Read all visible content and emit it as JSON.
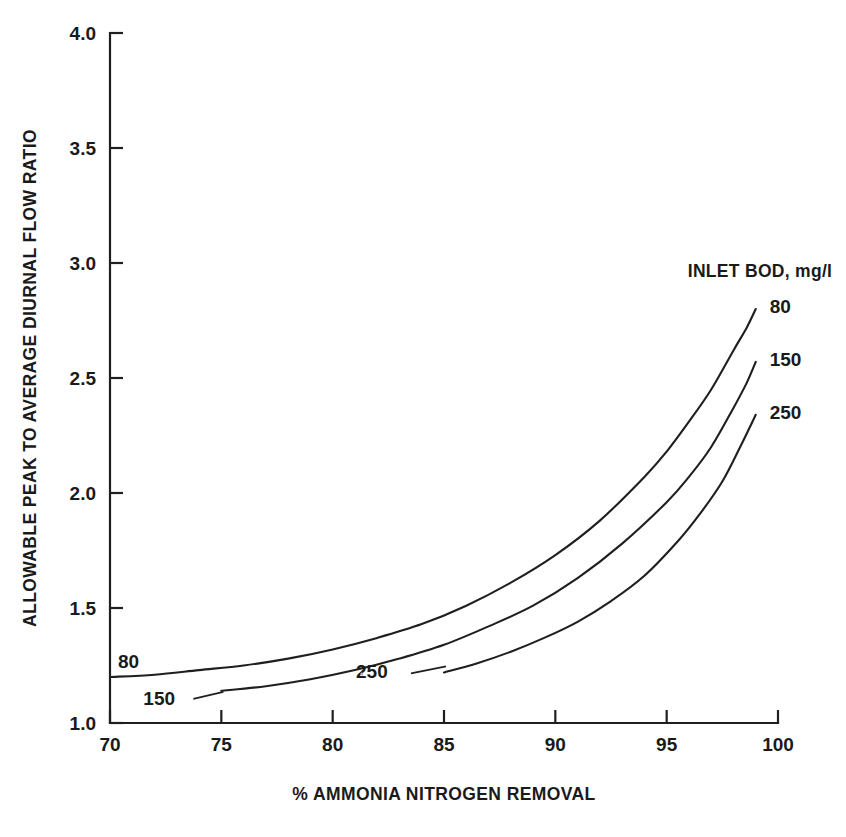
{
  "chart_data": {
    "type": "line",
    "title": "",
    "xlabel": "% AMMONIA NITROGEN REMOVAL",
    "ylabel": "ALLOWABLE PEAK TO AVERAGE DIURNAL FLOW RATIO",
    "xlim": [
      70,
      100
    ],
    "ylim": [
      1.0,
      4.0
    ],
    "xticks": [
      70,
      75,
      80,
      85,
      90,
      95,
      100
    ],
    "xtick_labels": [
      "70",
      "75",
      "80",
      "85",
      "90",
      "95",
      "100"
    ],
    "yticks": [
      1.0,
      1.5,
      2.0,
      2.5,
      3.0,
      3.5,
      4.0
    ],
    "ytick_labels": [
      "1.0",
      "1.5",
      "2.0",
      "2.5",
      "3.0",
      "3.5",
      "4.0"
    ],
    "grid": false,
    "legend_title": "INLET BOD, mg/l",
    "legend_position": "right-of-curve-ends",
    "series": [
      {
        "name": "80",
        "label": "80",
        "x": [
          70,
          72,
          74,
          76,
          78,
          80,
          82,
          84,
          86,
          88,
          90,
          92,
          94,
          95,
          96,
          97,
          98,
          98.6,
          99
        ],
        "y": [
          1.2,
          1.21,
          1.23,
          1.25,
          1.28,
          1.32,
          1.37,
          1.43,
          1.51,
          1.61,
          1.73,
          1.88,
          2.07,
          2.18,
          2.31,
          2.45,
          2.62,
          2.72,
          2.8
        ]
      },
      {
        "name": "150",
        "label": "150",
        "x": [
          75,
          77,
          79,
          81,
          83,
          85,
          87,
          89,
          91,
          93,
          95,
          96,
          97,
          98,
          98.6,
          99
        ],
        "y": [
          1.14,
          1.16,
          1.19,
          1.23,
          1.28,
          1.34,
          1.42,
          1.51,
          1.63,
          1.78,
          1.96,
          2.07,
          2.2,
          2.37,
          2.48,
          2.57
        ]
      },
      {
        "name": "250",
        "label": "250",
        "x": [
          85,
          86.5,
          88,
          89.5,
          91,
          92.5,
          94,
          95.5,
          96.5,
          97.5,
          98.3,
          99
        ],
        "y": [
          1.22,
          1.26,
          1.31,
          1.37,
          1.44,
          1.53,
          1.64,
          1.79,
          1.91,
          2.05,
          2.2,
          2.34
        ]
      }
    ],
    "series_end_labels": [
      {
        "name": "80",
        "text": "80",
        "value": 2.8
      },
      {
        "name": "150",
        "text": "150",
        "value": 2.57
      },
      {
        "name": "250",
        "text": "250",
        "value": 2.34
      }
    ],
    "series_start_labels": [
      {
        "name": "80",
        "text": "80",
        "at_x": 70,
        "at_y": 1.2
      },
      {
        "name": "150",
        "text": "150",
        "at_x": 75,
        "at_y": 1.14
      },
      {
        "name": "250",
        "text": "250",
        "at_x": 85,
        "at_y": 1.22
      }
    ]
  },
  "figure": {
    "axis_color": "#1f1f1f",
    "curve_color": "#1f1f1f",
    "background": "#ffffff"
  }
}
